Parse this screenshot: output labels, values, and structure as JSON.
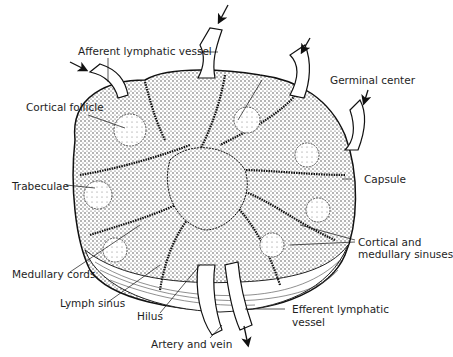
{
  "diagram": {
    "colors": {
      "ink": "#1a1a1a",
      "background": "#ffffff",
      "stipple": "#555555"
    },
    "labels": {
      "afferent": "Afferent lymphatic vessel",
      "cortical_follicle": "Cortical follicle",
      "germinal_center": "Germinal center",
      "trabeculae": "Trabeculae",
      "capsule": "Capsule",
      "cortical_sinuses_1": "Cortical and",
      "cortical_sinuses_2": "medullary sinuses",
      "medullary_cords": "Medullary cords",
      "lymph_sinus": "Lymph sinus",
      "hilus": "Hilus",
      "efferent_1": "Efferent lymphatic",
      "efferent_2": "vessel",
      "artery_vein": "Artery and vein"
    }
  }
}
